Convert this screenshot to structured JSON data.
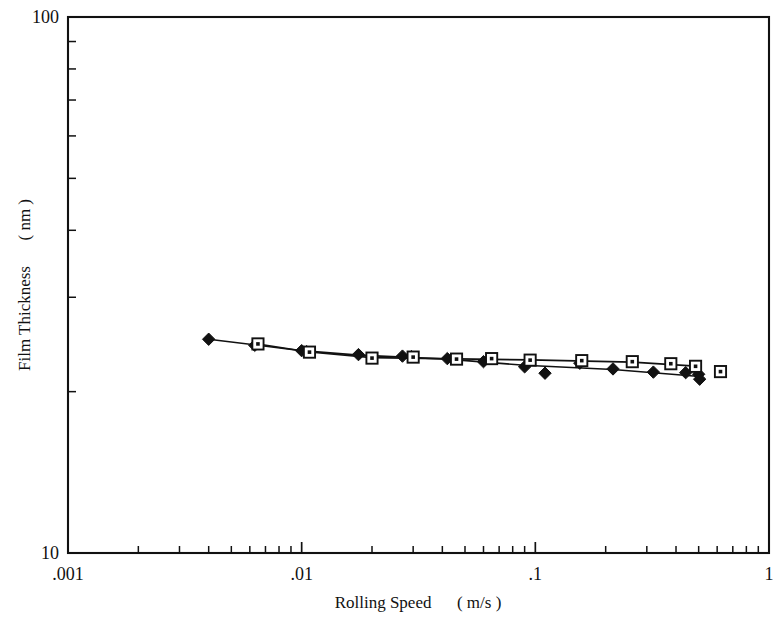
{
  "chart_data": {
    "type": "scatter",
    "title": "",
    "xlabel": "Rolling Speed",
    "xunit": "( m/s )",
    "ylabel": "Film Thickness",
    "yunit": "( nm )",
    "xscale": "log",
    "yscale": "log",
    "xlim": [
      0.001,
      1
    ],
    "ylim": [
      10,
      100
    ],
    "grid": false,
    "legend": "none",
    "xticks": [
      {
        "value": 0.001,
        "label": ".001"
      },
      {
        "value": 0.01,
        "label": ".01"
      },
      {
        "value": 0.1,
        "label": ".1"
      },
      {
        "value": 1,
        "label": "1"
      }
    ],
    "yticks": [
      {
        "value": 10,
        "label": "10"
      },
      {
        "value": 100,
        "label": "100"
      }
    ],
    "yminorticks": [
      20,
      30,
      40,
      50,
      60,
      70,
      80,
      90
    ],
    "series": [
      {
        "name": "series-diamond",
        "marker": "filled-diamond",
        "x": [
          0.004,
          0.0063,
          0.01,
          0.0105,
          0.0175,
          0.027,
          0.0295,
          0.042,
          0.06,
          0.09,
          0.11,
          0.155,
          0.215,
          0.32,
          0.44,
          0.5,
          0.505
        ],
        "y": [
          25.05,
          24.4,
          23.85,
          23.75,
          23.45,
          23.3,
          23.25,
          23.05,
          22.75,
          22.25,
          21.65,
          22.6,
          22.05,
          21.75,
          21.7,
          21.55,
          21.1
        ]
      },
      {
        "name": "series-square",
        "marker": "open-square-dot",
        "x": [
          0.0065,
          0.0108,
          0.02,
          0.03,
          0.046,
          0.065,
          0.095,
          0.158,
          0.26,
          0.38,
          0.485,
          0.62
        ],
        "y": [
          24.55,
          23.7,
          23.1,
          23.2,
          23.0,
          23.05,
          22.9,
          22.85,
          22.75,
          22.55,
          22.3,
          21.8
        ]
      }
    ],
    "trendlines": [
      {
        "name": "trend-diamond",
        "x": [
          0.004,
          0.01,
          0.0175,
          0.042,
          0.09,
          0.215,
          0.505
        ],
        "y": [
          25.05,
          23.85,
          23.4,
          23.0,
          22.4,
          22.0,
          21.35
        ]
      },
      {
        "name": "trend-square",
        "x": [
          0.0065,
          0.0108,
          0.02,
          0.046,
          0.095,
          0.26,
          0.485
        ],
        "y": [
          24.55,
          23.72,
          23.15,
          23.02,
          22.92,
          22.7,
          22.32
        ]
      }
    ]
  }
}
